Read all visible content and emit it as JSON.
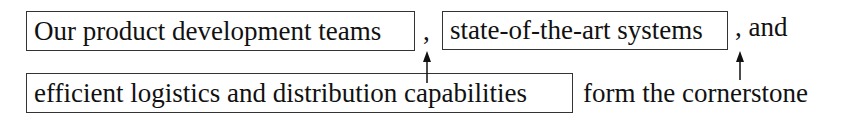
{
  "diagram": {
    "line1": {
      "box1": "Our product development teams",
      "sep1": ",",
      "box2": "state-of-the-art systems",
      "tail": ", and"
    },
    "line2": {
      "box3": "efficient logistics and distribution capabilities",
      "tail": "form the cornerstone"
    },
    "arrows": [
      {
        "from": "line2-box3",
        "to": "comma-after-box1",
        "x": 427
      },
      {
        "from": "line2-tail",
        "to": "comma-after-box2",
        "x": 740
      }
    ],
    "colors": {
      "text": "#111111",
      "border": "#333333",
      "background": "#ffffff"
    }
  }
}
